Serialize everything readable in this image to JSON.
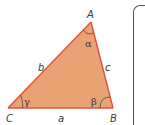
{
  "diagram": {
    "type": "triangle",
    "colors": {
      "fill": "#E9A274",
      "edge": "#E0503C",
      "text": "#3a3a3a",
      "panel_border": "#555555"
    },
    "vertices": [
      {
        "name": "A",
        "x": 91,
        "y": 22
      },
      {
        "name": "B",
        "x": 113,
        "y": 108
      },
      {
        "name": "C",
        "x": 8,
        "y": 108
      }
    ],
    "vertex_labels": {
      "A": "A",
      "B": "B",
      "C": "C"
    },
    "side_labels": {
      "a": "a",
      "b": "b",
      "c": "c"
    },
    "angle_labels": {
      "alpha": "α",
      "beta": "β",
      "gamma": "γ"
    }
  }
}
